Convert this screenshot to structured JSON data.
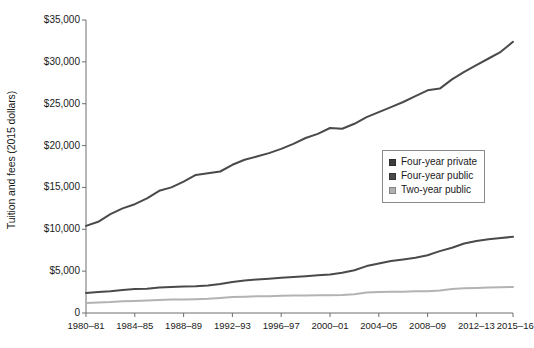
{
  "chart_data": {
    "type": "line",
    "title": "",
    "xlabel": "",
    "ylabel": "Tuition and fees (2015 dollars)",
    "ylim": [
      0,
      35000
    ],
    "ytick_labels": [
      "$35,000",
      "$30,000",
      "$25,000",
      "$20,000",
      "$15,000",
      "$10,000",
      "$5,000",
      "0"
    ],
    "ytick_values": [
      35000,
      30000,
      25000,
      20000,
      15000,
      10000,
      5000,
      0
    ],
    "grid": false,
    "legend_position": "center-right",
    "categories": [
      "1980-81",
      "1981-82",
      "1982-83",
      "1983-84",
      "1984-85",
      "1985-86",
      "1986-87",
      "1987-88",
      "1988-89",
      "1989-90",
      "1990-91",
      "1991-92",
      "1992-93",
      "1993-94",
      "1994-95",
      "1995-96",
      "1996-97",
      "1997-98",
      "1998-99",
      "1999-00",
      "2000-01",
      "2001-02",
      "2002-03",
      "2003-04",
      "2004-05",
      "2005-06",
      "2006-07",
      "2007-08",
      "2008-09",
      "2009-10",
      "2010-11",
      "2011-12",
      "2012-13",
      "2013-14",
      "2014-15",
      "2015-16"
    ],
    "xtick_labels": [
      "1980–81",
      "1984–85",
      "1988–89",
      "1992–93",
      "1996–97",
      "2000–01",
      "2004–05",
      "2008–09",
      "2012–13",
      "2015–16"
    ],
    "xtick_categories": [
      "1980-81",
      "1984-85",
      "1988-89",
      "1992-93",
      "1996-97",
      "2000-01",
      "2004-05",
      "2008-09",
      "2012-13",
      "2015-16"
    ],
    "series": [
      {
        "name": "Four-year private",
        "color": "#4a4a4a",
        "values": [
          10400,
          10900,
          11800,
          12500,
          13000,
          13700,
          14600,
          15000,
          15700,
          16500,
          16700,
          16900,
          17700,
          18300,
          18700,
          19100,
          19600,
          20200,
          20900,
          21400,
          22100,
          22000,
          22600,
          23400,
          24000,
          24600,
          25200,
          25900,
          26600,
          26800,
          27900,
          28800,
          29600,
          30400,
          31200,
          32400
        ]
      },
      {
        "name": "Four-year public",
        "color": "#4a4a4a",
        "values": [
          2400,
          2500,
          2600,
          2750,
          2850,
          2900,
          3050,
          3100,
          3150,
          3200,
          3300,
          3450,
          3700,
          3900,
          4000,
          4100,
          4200,
          4300,
          4400,
          4500,
          4600,
          4800,
          5100,
          5600,
          5900,
          6200,
          6400,
          6600,
          6900,
          7400,
          7800,
          8300,
          8600,
          8800,
          8950,
          9100
        ]
      },
      {
        "name": "Two-year public",
        "color": "#b3b3b3",
        "values": [
          1200,
          1250,
          1300,
          1400,
          1450,
          1500,
          1550,
          1600,
          1620,
          1650,
          1700,
          1800,
          1900,
          1950,
          2000,
          2000,
          2050,
          2080,
          2100,
          2120,
          2120,
          2150,
          2250,
          2450,
          2500,
          2550,
          2550,
          2600,
          2600,
          2700,
          2850,
          2950,
          3000,
          3050,
          3080,
          3100
        ]
      }
    ]
  },
  "legend": {
    "items": [
      {
        "label": "Four-year private",
        "color": "#3d3d3d"
      },
      {
        "label": "Four-year public",
        "color": "#4a4a4a"
      },
      {
        "label": "Two-year public",
        "color": "#b0b0b0"
      }
    ]
  },
  "axis": {
    "color": "#6e6e6e"
  }
}
